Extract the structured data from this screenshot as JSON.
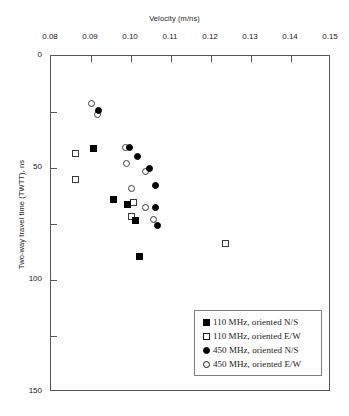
{
  "chart_data": {
    "type": "scatter",
    "title": "",
    "xlabel": "Velocity (m/ns)",
    "ylabel": "Two-way travel time (TWTT), ns",
    "xlim": [
      0.08,
      0.15
    ],
    "ylim": [
      0,
      150
    ],
    "y_inverted": true,
    "grid": false,
    "legend_position": "bottom-right",
    "xticks": [
      "0.08",
      "0.09",
      "0.10",
      "0.11",
      "0.12",
      "0.13",
      "0.14",
      "0.15"
    ],
    "xtick_values": [
      0.08,
      0.09,
      0.1,
      0.11,
      0.12,
      0.13,
      0.14,
      0.15
    ],
    "yticks": [
      "0",
      "50",
      "100",
      "150"
    ],
    "ytick_values": [
      0,
      50,
      100,
      150
    ],
    "yminor_values": [
      25,
      75,
      125
    ],
    "series": [
      {
        "name": "110 MHz, oriented N/S",
        "marker": "square",
        "fill": "filled",
        "color": "#000000",
        "points": [
          {
            "x": 0.0905,
            "y": 41.5
          },
          {
            "x": 0.0955,
            "y": 64.0
          },
          {
            "x": 0.099,
            "y": 66.5
          },
          {
            "x": 0.101,
            "y": 73.5
          },
          {
            "x": 0.102,
            "y": 89.5
          }
        ]
      },
      {
        "name": "110 MHz, oriented E/W",
        "marker": "square",
        "fill": "open",
        "color": "#ffffff",
        "points": [
          {
            "x": 0.086,
            "y": 43.5
          },
          {
            "x": 0.086,
            "y": 55.0
          },
          {
            "x": 0.1005,
            "y": 65.5
          },
          {
            "x": 0.1,
            "y": 71.5
          },
          {
            "x": 0.1235,
            "y": 83.5
          }
        ]
      },
      {
        "name": "450 MHz, oriented N/S",
        "marker": "circle",
        "fill": "filled",
        "color": "#000000",
        "points": [
          {
            "x": 0.0918,
            "y": 24.5
          },
          {
            "x": 0.0995,
            "y": 41.0
          },
          {
            "x": 0.1015,
            "y": 45.0
          },
          {
            "x": 0.1045,
            "y": 50.0
          },
          {
            "x": 0.106,
            "y": 58.0
          },
          {
            "x": 0.106,
            "y": 67.5
          },
          {
            "x": 0.1065,
            "y": 75.5
          }
        ]
      },
      {
        "name": "450 MHz, oriented E/W",
        "marker": "circle",
        "fill": "open",
        "color": "#ffffff",
        "points": [
          {
            "x": 0.09,
            "y": 21.0
          },
          {
            "x": 0.0915,
            "y": 26.0
          },
          {
            "x": 0.0985,
            "y": 41.0
          },
          {
            "x": 0.0988,
            "y": 48.0
          },
          {
            "x": 0.1035,
            "y": 51.5
          },
          {
            "x": 0.1,
            "y": 59.0
          },
          {
            "x": 0.1035,
            "y": 67.5
          },
          {
            "x": 0.1055,
            "y": 73.0
          }
        ]
      }
    ]
  },
  "legend": {
    "items": [
      {
        "label": "110 MHz, oriented N/S",
        "marker": "square",
        "fill": "filled"
      },
      {
        "label": "110 MHz, oriented E/W",
        "marker": "square",
        "fill": "open"
      },
      {
        "label": "450 MHz, oriented N/S",
        "marker": "circle",
        "fill": "filled"
      },
      {
        "label": "450 MHz, oriented E/W",
        "marker": "circle",
        "fill": "open"
      }
    ]
  }
}
